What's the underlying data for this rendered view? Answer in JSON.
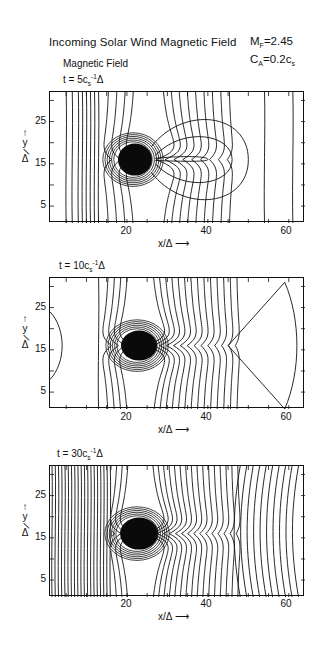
{
  "figure": {
    "title": "Incoming Solar Wind Magnetic Field",
    "params": [
      {
        "symbol": "M",
        "sub": "F",
        "value": "=2.45"
      },
      {
        "symbol": "C",
        "sub": "A",
        "value": "=0.2c",
        "value_sub": "s"
      }
    ],
    "subtitle": "Magnetic Field"
  },
  "axes": {
    "xlabel": "x/Δ",
    "xlabel_arrow": "⟶",
    "ylabel_top": "y",
    "ylabel_bottom": "Δ",
    "ylabel_arrow": "↑",
    "xticks": [
      "20",
      "40",
      "60"
    ],
    "yticks": [
      "25",
      "15",
      "5"
    ]
  },
  "panels": [
    {
      "time_prefix": "t = 5c",
      "time_sub": "s",
      "time_sup": "-1",
      "time_suffix": "Δ"
    },
    {
      "time_prefix": "t = 10c",
      "time_sub": "s",
      "time_sup": "-1",
      "time_suffix": "Δ"
    },
    {
      "time_prefix": "t = 30c",
      "time_sub": "s",
      "time_sup": "-1",
      "time_suffix": "Δ"
    }
  ],
  "chart_data": [
    {
      "type": "heatmap",
      "subtype": "contour",
      "title": "Incoming Solar Wind Magnetic Field — t = 5 c_s^-1 Δ",
      "xlabel": "x/Δ",
      "ylabel": "y/Δ",
      "xlim": [
        1,
        64
      ],
      "ylim": [
        1,
        32
      ],
      "xticks": [
        20,
        40,
        60
      ],
      "yticks": [
        5,
        15,
        25
      ],
      "params": {
        "M_F": 2.45,
        "C_A": "0.2 c_s"
      },
      "features": {
        "dense_core_center": [
          22,
          16
        ],
        "dense_core_extent_x": [
          18,
          26
        ],
        "closed_lobe_tip_x": 40,
        "upstream_vertical_lines_x": [
          5,
          13
        ],
        "downstream_vertical_lines_x": [
          54,
          61
        ]
      }
    },
    {
      "type": "heatmap",
      "subtype": "contour",
      "title": "Incoming Solar Wind Magnetic Field — t = 10 c_s^-1 Δ",
      "xlabel": "x/Δ",
      "ylabel": "y/Δ",
      "xlim": [
        1,
        64
      ],
      "ylim": [
        1,
        32
      ],
      "xticks": [
        20,
        40,
        60
      ],
      "yticks": [
        5,
        15,
        25
      ],
      "features": {
        "dense_core_center": [
          23,
          16
        ],
        "dense_core_extent_x": [
          18,
          28
        ],
        "left_arc_x": 3,
        "vertical_line_x": 13,
        "right_diamond_vertex_x": [
          45,
          62
        ]
      }
    },
    {
      "type": "heatmap",
      "subtype": "contour",
      "title": "Incoming Solar Wind Magnetic Field — t = 30 c_s^-1 Δ",
      "xlabel": "x/Δ",
      "ylabel": "y/Δ",
      "xlim": [
        1,
        64
      ],
      "ylim": [
        1,
        32
      ],
      "xticks": [
        20,
        40,
        60
      ],
      "yticks": [
        5,
        15,
        25
      ],
      "features": {
        "dense_core_center": [
          23,
          16
        ],
        "dense_core_extent_x": [
          18,
          28
        ],
        "dense_vertical_lines_x_range": [
          1,
          16
        ],
        "x_point_x": 46
      }
    }
  ]
}
